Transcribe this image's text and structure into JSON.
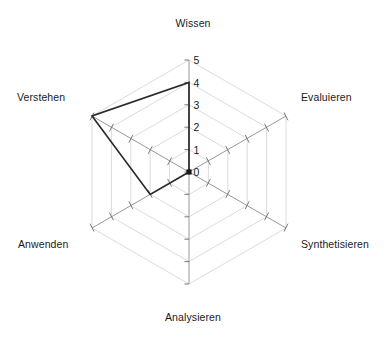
{
  "chart_data": {
    "type": "radar",
    "title": "",
    "subtitle": "",
    "xlabel": "",
    "ylabel": "",
    "categories": [
      "Wissen",
      "Evaluieren",
      "Synthetisieren",
      "Analysieren",
      "Anwenden",
      "Verstehen"
    ],
    "series": [
      {
        "name": "",
        "values": [
          4,
          0,
          0,
          0,
          2,
          5
        ]
      }
    ],
    "ylim": [
      0,
      5
    ],
    "tick_labels": [
      "0",
      "1",
      "2",
      "3",
      "4",
      "5"
    ],
    "tick_values": [
      0,
      1,
      2,
      3,
      4,
      5
    ],
    "tick_axis": "Wissen",
    "grid": true,
    "grid_shape": "polygon",
    "grid_rings": 5,
    "legend": false,
    "legend_position": "none",
    "fill": false,
    "annotations": []
  },
  "labels": {
    "wissen": "Wissen",
    "evaluieren": "Evaluieren",
    "synthetisieren": "Synthetisieren",
    "analysieren": "Analysieren",
    "anwenden": "Anwenden",
    "verstehen": "Verstehen"
  },
  "ticks": {
    "t0": "0",
    "t1": "1",
    "t2": "2",
    "t3": "3",
    "t4": "4",
    "t5": "5"
  },
  "colors": {
    "background": "#ffffff",
    "data_line": "#2b2b2b",
    "grid_ring": "#d2d2d2",
    "spoke": "#8c8c8c",
    "text": "#1a1a1a"
  }
}
